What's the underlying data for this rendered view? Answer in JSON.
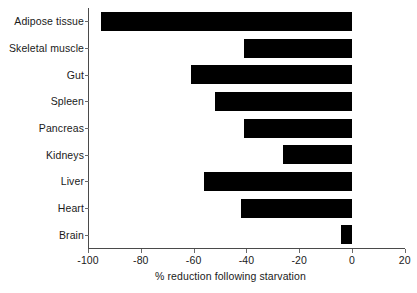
{
  "chart_data": {
    "type": "bar",
    "orientation": "horizontal",
    "title": "",
    "xlabel": "% reduction following starvation",
    "ylabel": "",
    "categories": [
      "Adipose tissue",
      "Skeletal muscle",
      "Gut",
      "Spleen",
      "Pancreas",
      "Kidneys",
      "Liver",
      "Heart",
      "Brain"
    ],
    "values": [
      -95,
      -41,
      -61,
      -52,
      -41,
      -26,
      -56,
      -42,
      -4
    ],
    "xlim": [
      -100,
      20
    ],
    "xticks": [
      -100,
      -80,
      -60,
      -40,
      -20,
      0,
      20
    ],
    "xtick_labels": [
      "-100",
      "-80",
      "-60",
      "-40",
      "-20",
      "0",
      "20"
    ],
    "grid": false,
    "legend": null,
    "bar_color": "#000000",
    "axis_color": "#4a4a4a",
    "background": "#ffffff"
  }
}
